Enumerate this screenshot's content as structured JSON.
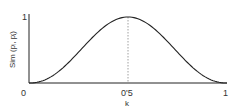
{
  "chart_data": {
    "type": "line",
    "title": "",
    "xlabel": "k",
    "ylabel": "Sim (pᵢ, pⱼ)",
    "xlim": [
      0,
      1
    ],
    "ylim": [
      0,
      1
    ],
    "x_ticks": [
      "0",
      "0'5",
      "1"
    ],
    "y_ticks": [
      "0",
      "1"
    ],
    "grid": false,
    "legend": null,
    "annotations": [
      "dotted vertical line at k = 0.5"
    ],
    "series": [
      {
        "name": "similarity",
        "x": [
          0,
          0.1,
          0.2,
          0.3,
          0.4,
          0.5,
          0.6,
          0.7,
          0.8,
          0.9,
          1.0
        ],
        "y": [
          0.0,
          0.05,
          0.22,
          0.52,
          0.85,
          1.0,
          0.85,
          0.52,
          0.22,
          0.05,
          0.0
        ]
      }
    ]
  },
  "labels": {
    "x_tick_0": "0",
    "x_tick_mid": "0'5",
    "x_tick_1": "1",
    "y_tick_1": "1",
    "xlabel": "k",
    "ylabel": "Sim (pᵢ, pⱼ)"
  }
}
